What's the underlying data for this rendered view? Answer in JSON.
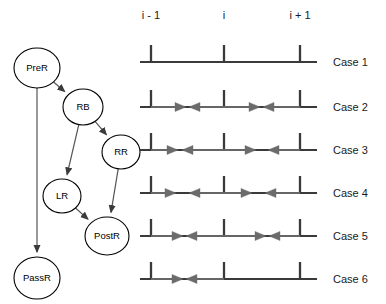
{
  "figure": {
    "title": "",
    "width": 386,
    "height": 304,
    "background": "#ffffff"
  },
  "graph": {
    "name": "state-transition-graph",
    "node_stroke": "#000000",
    "edge_color": "#555555",
    "nodes": [
      {
        "id": "PreR",
        "label": "PreR",
        "cx": 37,
        "cy": 68,
        "rx": 23,
        "ry": 20
      },
      {
        "id": "RB",
        "label": "RB",
        "cx": 83,
        "cy": 107,
        "rx": 20,
        "ry": 18
      },
      {
        "id": "RR",
        "label": "RR",
        "cx": 121,
        "cy": 152,
        "rx": 19,
        "ry": 17
      },
      {
        "id": "LR",
        "label": "LR",
        "cx": 62,
        "cy": 196,
        "rx": 19,
        "ry": 17
      },
      {
        "id": "PostR",
        "label": "PostR",
        "cx": 107,
        "cy": 236,
        "rx": 22,
        "ry": 19
      },
      {
        "id": "PassR",
        "label": "PassR",
        "cx": 37,
        "cy": 278,
        "rx": 23,
        "ry": 21
      }
    ],
    "edges": [
      {
        "from": "PreR",
        "to": "RB"
      },
      {
        "from": "PreR",
        "to": "PassR"
      },
      {
        "from": "RB",
        "to": "RR"
      },
      {
        "from": "RB",
        "to": "LR"
      },
      {
        "from": "RR",
        "to": "PostR"
      },
      {
        "from": "LR",
        "to": "PostR"
      }
    ]
  },
  "chart_data": {
    "type": "diagram",
    "title": "",
    "xlabel": "",
    "ylabel": "",
    "axis_ticks": [
      {
        "label": "i - 1",
        "x": 151
      },
      {
        "label": "i",
        "x": 224
      },
      {
        "label": "i + 1",
        "x": 300
      }
    ],
    "line_color": "#3a3a3a",
    "arrow_color": "#6b6b6b",
    "baseline_start_x": 140,
    "baseline_end_x": 317,
    "cases": [
      {
        "label": "Case 1",
        "y": 62,
        "arrows": []
      },
      {
        "label": "Case 2",
        "y": 107,
        "arrows": [
          {
            "dir": "right",
            "from": 151,
            "to": 186
          },
          {
            "dir": "left",
            "from": 224,
            "to": 189
          },
          {
            "dir": "right",
            "from": 224,
            "to": 260
          },
          {
            "dir": "left",
            "from": 300,
            "to": 263
          }
        ]
      },
      {
        "label": "Case 3",
        "y": 150,
        "arrows": [
          {
            "dir": "right",
            "from": 151,
            "to": 178
          },
          {
            "dir": "left",
            "from": 224,
            "to": 182
          },
          {
            "dir": "right",
            "from": 224,
            "to": 256
          },
          {
            "dir": "left",
            "from": 300,
            "to": 268
          }
        ]
      },
      {
        "label": "Case 4",
        "y": 193,
        "arrows": [
          {
            "dir": "right",
            "from": 151,
            "to": 176
          },
          {
            "dir": "left",
            "from": 224,
            "to": 189
          },
          {
            "dir": "right",
            "from": 224,
            "to": 252
          },
          {
            "dir": "left",
            "from": 300,
            "to": 265
          }
        ]
      },
      {
        "label": "Case 5",
        "y": 236,
        "arrows": [
          {
            "dir": "right",
            "from": 151,
            "to": 183
          },
          {
            "dir": "left",
            "from": 224,
            "to": 186
          },
          {
            "dir": "right",
            "from": 224,
            "to": 266
          },
          {
            "dir": "left",
            "from": 300,
            "to": 269
          }
        ]
      },
      {
        "label": "Case 6",
        "y": 279,
        "arrows": [
          {
            "dir": "right",
            "from": 151,
            "to": 183
          },
          {
            "dir": "left",
            "from": 224,
            "to": 186
          }
        ]
      }
    ]
  }
}
